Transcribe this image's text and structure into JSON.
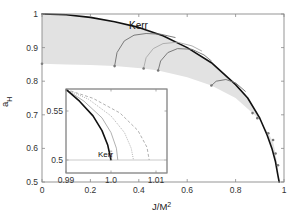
{
  "chart_data": [
    {
      "type": "line",
      "title": "",
      "xlabel": "J/M^2",
      "ylabel": "a_H",
      "xlim": [
        0,
        1
      ],
      "ylim": [
        0.5,
        1
      ],
      "xticks": [
        0,
        0.2,
        0.4,
        0.6,
        0.8,
        1
      ],
      "xtick_labels": [
        "0",
        "0.2",
        "0.4",
        "0.6",
        "0.8",
        "1"
      ],
      "yticks": [
        0.5,
        0.6,
        0.7,
        0.8,
        0.9,
        1
      ],
      "ytick_labels": [
        "0.5",
        "0.6",
        "0.7",
        "0.8",
        "0.9",
        "1"
      ],
      "grid": false,
      "annotations": [
        {
          "text": "Kerr",
          "x": 0.46,
          "y": 0.965
        }
      ],
      "series": [
        {
          "name": "Kerr",
          "style": "solid-black-thick",
          "x": [
            0,
            0.1,
            0.2,
            0.3,
            0.4,
            0.5,
            0.6,
            0.7,
            0.8,
            0.85,
            0.9,
            0.93,
            0.95,
            0.965,
            0.975,
            0.98
          ],
          "y": [
            1.0,
            0.998,
            0.99,
            0.977,
            0.96,
            0.935,
            0.9,
            0.855,
            0.79,
            0.75,
            0.69,
            0.64,
            0.6,
            0.56,
            0.52,
            0.5
          ]
        },
        {
          "name": "hairy BH domain lower boundary",
          "style": "shaded-region-edge",
          "x": [
            0,
            0.1,
            0.2,
            0.3,
            0.42,
            0.48,
            0.6,
            0.7,
            0.8,
            0.87,
            0.9,
            0.935,
            0.955,
            0.965,
            0.975,
            0.98
          ],
          "y": [
            0.852,
            0.85,
            0.848,
            0.845,
            0.838,
            0.832,
            0.812,
            0.787,
            0.75,
            0.705,
            0.685,
            0.645,
            0.62,
            0.585,
            0.54,
            0.5
          ]
        },
        {
          "name": "arc 1",
          "style": "solid-gray",
          "x": [
            0.3,
            0.31,
            0.34,
            0.38,
            0.43,
            0.49,
            0.55
          ],
          "y": [
            0.845,
            0.885,
            0.92,
            0.937,
            0.942,
            0.94,
            0.93
          ]
        },
        {
          "name": "arc 2",
          "style": "solid-lightgray",
          "x": [
            0.42,
            0.43,
            0.46,
            0.5,
            0.56,
            0.62,
            0.66
          ],
          "y": [
            0.838,
            0.87,
            0.897,
            0.912,
            0.916,
            0.905,
            0.89
          ]
        },
        {
          "name": "arc 3",
          "style": "solid-gray",
          "x": [
            0.48,
            0.49,
            0.52,
            0.56,
            0.62,
            0.67,
            0.7
          ],
          "y": [
            0.832,
            0.86,
            0.885,
            0.897,
            0.895,
            0.878,
            0.86
          ]
        },
        {
          "name": "arc 4",
          "style": "solid-gray",
          "x": [
            0.7,
            0.72,
            0.76,
            0.8,
            0.84
          ],
          "y": [
            0.787,
            0.8,
            0.805,
            0.795,
            0.77
          ]
        }
      ],
      "markers": {
        "x": [
          0,
          0.3,
          0.42,
          0.48,
          0.7,
          0.87,
          0.89,
          0.935,
          0.955,
          0.965,
          0.975
        ],
        "y": [
          0.852,
          0.845,
          0.838,
          0.832,
          0.787,
          0.705,
          0.69,
          0.645,
          0.625,
          0.585,
          0.55
        ]
      },
      "shaded_region": {
        "color": "#e2e2e2",
        "between": [
          "Kerr",
          "hairy BH domain lower boundary"
        ]
      }
    },
    {
      "type": "line",
      "title": "inset",
      "xlabel": "",
      "ylabel": "",
      "xlim": [
        0.99,
        1.012
      ],
      "ylim": [
        0.495,
        0.572
      ],
      "xticks": [
        0.99,
        1.0,
        1.01
      ],
      "xtick_labels": [
        "0.99",
        "1.0",
        "1.01"
      ],
      "yticks": [
        0.5,
        0.55
      ],
      "ytick_labels": [
        "0.5",
        "0.55"
      ],
      "annotations": [
        {
          "text": "Kerr",
          "x": 0.9955,
          "y": 0.507
        }
      ],
      "series": [
        {
          "name": "Kerr",
          "style": "solid-black-thick",
          "x": [
            0.99,
            0.993,
            0.996,
            0.998,
            0.9993,
            1.0
          ],
          "y": [
            0.572,
            0.56,
            0.545,
            0.53,
            0.515,
            0.5
          ]
        },
        {
          "name": "curve 2",
          "style": "solid-lightgray",
          "x": [
            0.99,
            0.994,
            0.998,
            1.0,
            1.0012,
            1.0015
          ],
          "y": [
            0.572,
            0.56,
            0.543,
            0.528,
            0.512,
            0.5
          ]
        },
        {
          "name": "curve 3",
          "style": "dotted-gray",
          "x": [
            0.99,
            0.995,
            1.0,
            1.003,
            1.0045,
            1.005
          ],
          "y": [
            0.572,
            0.562,
            0.545,
            0.528,
            0.512,
            0.5
          ]
        },
        {
          "name": "curve 4",
          "style": "dashed-gray",
          "x": [
            0.99,
            0.996,
            1.002,
            1.006,
            1.008,
            1.0085
          ],
          "y": [
            0.572,
            0.563,
            0.548,
            0.53,
            0.513,
            0.5
          ]
        },
        {
          "name": "a_H = 0.5 line",
          "style": "solid-lightgray",
          "x": [
            0.99,
            1.012
          ],
          "y": [
            0.5,
            0.5
          ]
        }
      ]
    }
  ],
  "labels": {
    "ylabel_main": "a",
    "ylabel_sub": "H",
    "xlabel_main": "J/M",
    "xlabel_sup": "2",
    "kerr_main": "Kerr",
    "kerr_inset": "Kerr"
  },
  "colors": {
    "shade": "#e2e2e2",
    "kerr": "#111111",
    "arc": "#6e6e6e",
    "arc_light": "#a8a8a8",
    "marker": "#777777",
    "frame": "#8a8a8a"
  }
}
